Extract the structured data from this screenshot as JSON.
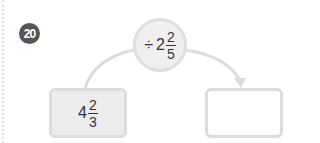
{
  "problem": {
    "number": "20"
  },
  "operator": {
    "sign": "÷",
    "whole": "2",
    "numerator": "2",
    "denominator": "5"
  },
  "start_value": {
    "whole": "4",
    "numerator": "2",
    "denominator": "3"
  },
  "answer_box": {
    "value": ""
  },
  "colors": {
    "badge": "#555555",
    "circle_fill": "#efefef",
    "border": "#dcdcdc",
    "start_box_fill": "#ececec"
  }
}
